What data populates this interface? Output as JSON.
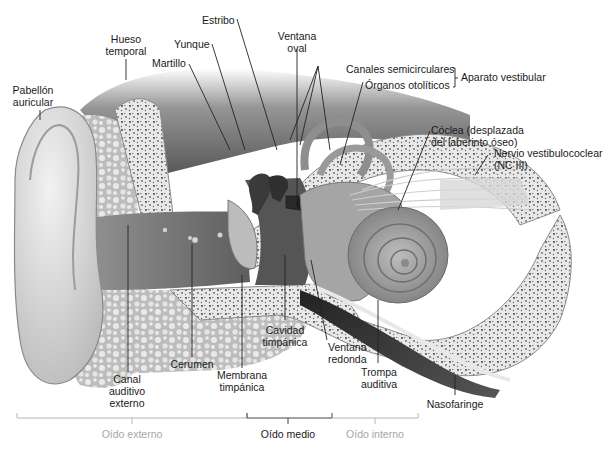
{
  "diagram": {
    "colors": {
      "background": "#ffffff",
      "label_text": "#1a1a1a",
      "muted_region_text": "#a6a6a6",
      "bone": "#e6e6e6",
      "bone_spots": "#5a5a5a",
      "tissue_dark": "#4a4a4a",
      "canal": "#7a7a7a",
      "auricle": "#d8d8d8",
      "cochlea": "#9a9a9a"
    },
    "labels": {
      "pabellon": [
        "Pabellón",
        "auricular"
      ],
      "hueso": [
        "Hueso",
        "temporal"
      ],
      "martillo": [
        "Martillo"
      ],
      "yunque": [
        "Yunque"
      ],
      "estribo": [
        "Estribo"
      ],
      "ventana_oval": [
        "Ventana",
        "oval"
      ],
      "canales": [
        "Canales semicirculares"
      ],
      "organos": [
        "Órganos otolíticos"
      ],
      "aparato": [
        "Aparato vestibular"
      ],
      "coclea": [
        "Cóclea (desplazada",
        "del laberinto óseo)"
      ],
      "nervio": [
        "Nervio vestibulococlear",
        "(NC III)"
      ],
      "canal_auditivo": [
        "Canal",
        "auditivo",
        "externo"
      ],
      "cerumen": [
        "Cerumen"
      ],
      "membrana": [
        "Membrana",
        "timpánica"
      ],
      "cavidad": [
        "Cavidad",
        "timpánica"
      ],
      "ventana_redonda": [
        "Ventana",
        "redonda"
      ],
      "trompa": [
        "Trompa",
        "auditiva"
      ],
      "nasofaringe": [
        "Nasofaringe"
      ]
    },
    "regions": {
      "externo": "Oído externo",
      "medio": "Oído medio",
      "interno": "Oído interno"
    }
  }
}
